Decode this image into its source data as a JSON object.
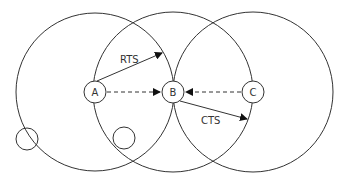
{
  "diagram": {
    "nodes": [
      {
        "id": "A",
        "label": "A",
        "cx": 95,
        "cy": 92
      },
      {
        "id": "B",
        "label": "B",
        "cx": 173,
        "cy": 92
      },
      {
        "id": "C",
        "label": "C",
        "cx": 253,
        "cy": 92
      }
    ],
    "ranges": [
      {
        "node": "A",
        "cx": 95,
        "cy": 92,
        "r": 79
      },
      {
        "node": "B",
        "cx": 173,
        "cy": 92,
        "r": 80
      },
      {
        "node": "C",
        "cx": 253,
        "cy": 92,
        "r": 80
      }
    ],
    "extra_nodes": [
      {
        "cx": 27,
        "cy": 139,
        "r": 11
      },
      {
        "cx": 124,
        "cy": 138,
        "r": 11
      }
    ],
    "edges": [
      {
        "from": "A",
        "to": "B",
        "style": "dashed",
        "label": ""
      },
      {
        "from": "C",
        "to": "B",
        "style": "dashed",
        "label": ""
      },
      {
        "from": "A",
        "to": "point",
        "style": "solid",
        "label": "RTS"
      },
      {
        "from": "B",
        "to": "point",
        "style": "solid",
        "label": "CTS"
      }
    ],
    "labels": {
      "rts": "RTS",
      "cts": "CTS",
      "a": "A",
      "b": "B",
      "c": "C"
    }
  }
}
